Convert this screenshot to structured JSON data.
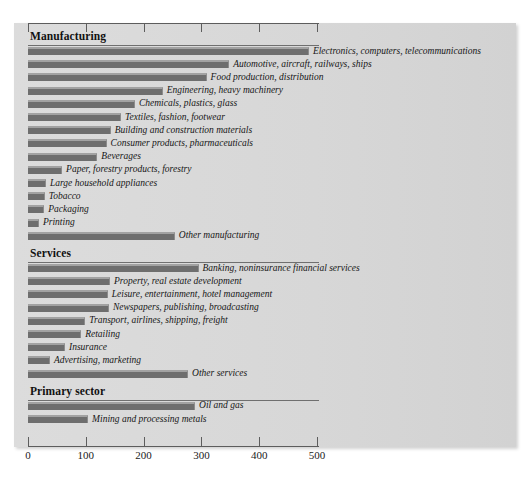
{
  "chart_data": {
    "type": "bar",
    "orientation": "horizontal",
    "title": "",
    "xlabel": "",
    "ylabel": "",
    "xlim": [
      0,
      530
    ],
    "xticks": [
      0,
      100,
      200,
      300,
      400,
      500
    ],
    "xtick_labels": [
      "0",
      "100",
      "200",
      "300",
      "400",
      "500"
    ],
    "grid": false,
    "legend": "none",
    "colors": {
      "bar_fill": "#6e6e6e",
      "bar_highlight": "#a2a2a2",
      "panel_background": "#d9d9d9",
      "axis": "#5d5d5d",
      "text": "#161616"
    },
    "sections": [
      {
        "name": "Manufacturing",
        "categories": [
          "Electronics, computers, telecommunications",
          "Automotive, aircraft, railways, ships",
          "Food production, distribution",
          "Engineering, heavy machinery",
          "Chemicals, plastics, glass",
          "Textiles, fashion, footwear",
          "Building and construction materials",
          "Consumer products, pharmaceuticals",
          "Beverages",
          "Paper, forestry products, forestry",
          "Large household appliances",
          "Tobacco",
          "Packaging",
          "Printing",
          "Other manufacturing"
        ],
        "values": [
          486,
          348,
          309,
          233,
          185,
          161,
          143,
          136,
          120,
          59,
          31,
          29,
          28,
          19,
          254
        ]
      },
      {
        "name": "Services",
        "categories": [
          "Banking, noninsurance financial services",
          "Property, real estate development",
          "Leisure, entertainment, hotel management",
          "Newspapers, publishing, broadcasting",
          "Transport, airlines, shipping, freight",
          "Retailing",
          "Insurance",
          "Advertising, marketing",
          "Other services"
        ],
        "values": [
          295,
          142,
          138,
          140,
          99,
          92,
          64,
          38,
          277
        ]
      },
      {
        "name": "Primary sector",
        "categories": [
          "Oil and gas",
          "Mining and processing metals"
        ],
        "values": [
          289,
          104
        ]
      }
    ]
  }
}
